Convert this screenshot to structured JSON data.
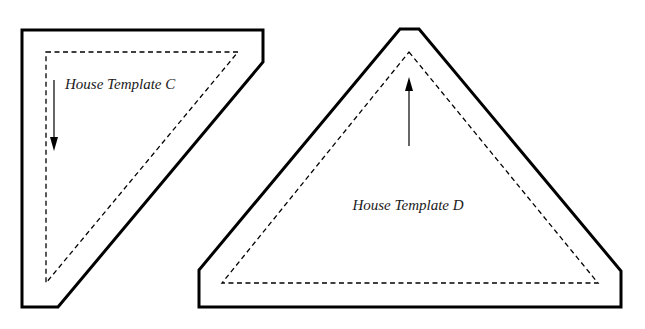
{
  "diagram": {
    "type": "quilt-pattern-templates",
    "colors": {
      "background": "#ffffff",
      "line": "#000000",
      "text": "#1a1a1a"
    },
    "templates": [
      {
        "id": "C",
        "label": "House Template C",
        "shape": "right-triangle-with-seam-allowance",
        "cut_line": "solid",
        "sew_line": "dashed",
        "grain_arrow": "down"
      },
      {
        "id": "D",
        "label": "House Template D",
        "shape": "isosceles-triangle-with-seam-allowance",
        "cut_line": "solid",
        "sew_line": "dashed",
        "grain_arrow": "up"
      }
    ]
  }
}
